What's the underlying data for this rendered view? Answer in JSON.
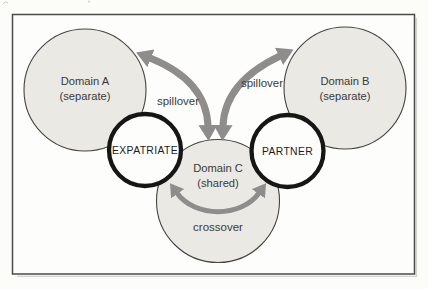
{
  "colors": {
    "page_bg": "#fcfcf9",
    "frame_fill": "#fdfdfb",
    "frame_stroke": "#4a4a48",
    "domain_fill": "#eae9e4",
    "domain_stroke": "#454440",
    "node_fill": "#fdfdfc",
    "node_stroke": "#161614",
    "arrow": "#8e8d8b",
    "label_text": "#3b3a36",
    "node_text": "#1c1c1a"
  },
  "diagram": {
    "domain_a": {
      "line1": "Domain A",
      "line2": "(separate)"
    },
    "domain_b": {
      "line1": "Domain B",
      "line2": "(separate)"
    },
    "domain_c": {
      "line1": "Domain C",
      "line2": "(shared)"
    },
    "expatriate_label": "EXPATRIATE",
    "partner_label": "PARTNER",
    "spillover_left_label": "spillover",
    "spillover_right_label": "spillover",
    "crossover_label": "crossover"
  }
}
